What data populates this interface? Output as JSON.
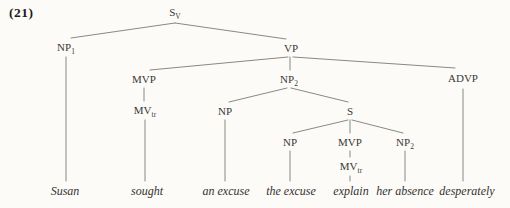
{
  "figure": {
    "number_label": "(21)"
  },
  "colors": {
    "background": "#fcfbf8",
    "node_text": "#3a3936",
    "terminal_text": "#33322f",
    "edge_line": "#7c7a76"
  },
  "tree": {
    "nodes": {
      "s_v": {
        "base": "S",
        "sub": "V"
      },
      "np1": {
        "base": "NP",
        "sub": "1"
      },
      "vp": {
        "base": "VP"
      },
      "mvp_main": {
        "base": "MVP"
      },
      "np2_obj": {
        "base": "NP",
        "sub": "2"
      },
      "advp": {
        "base": "ADVP"
      },
      "mv_tr_main": {
        "base": "MV",
        "sub": "tr"
      },
      "np_det": {
        "base": "NP"
      },
      "s_emb": {
        "base": "S"
      },
      "np_emb_subj": {
        "base": "NP"
      },
      "mvp_emb": {
        "base": "MVP"
      },
      "np2_emb": {
        "base": "NP",
        "sub": "2"
      },
      "mv_tr_emb": {
        "base": "MV",
        "sub": "tr"
      }
    },
    "terminals": {
      "susan": "Susan",
      "sought": "sought",
      "an_excuse": "an excuse",
      "the_excuse": "the excuse",
      "explain": "explain",
      "her_absence": "her absence",
      "desperately": "desperately"
    },
    "edges": [
      [
        "s_v",
        "np1"
      ],
      [
        "s_v",
        "vp"
      ],
      [
        "np1",
        "susan"
      ],
      [
        "vp",
        "mvp_main"
      ],
      [
        "vp",
        "np2_obj"
      ],
      [
        "vp",
        "advp"
      ],
      [
        "mvp_main",
        "mv_tr_main"
      ],
      [
        "mv_tr_main",
        "sought"
      ],
      [
        "np2_obj",
        "np_det"
      ],
      [
        "np2_obj",
        "s_emb"
      ],
      [
        "np_det",
        "an_excuse"
      ],
      [
        "s_emb",
        "np_emb_subj"
      ],
      [
        "s_emb",
        "mvp_emb"
      ],
      [
        "s_emb",
        "np2_emb"
      ],
      [
        "np_emb_subj",
        "the_excuse"
      ],
      [
        "mvp_emb",
        "mv_tr_emb"
      ],
      [
        "mv_tr_emb",
        "explain"
      ],
      [
        "np2_emb",
        "her_absence"
      ],
      [
        "advp",
        "desperately"
      ]
    ]
  }
}
